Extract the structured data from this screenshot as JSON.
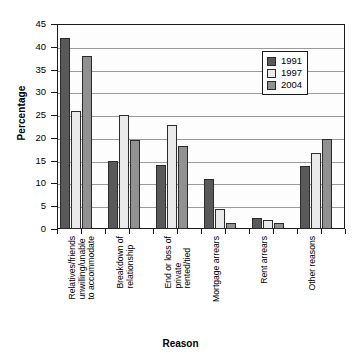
{
  "chart_data": {
    "type": "bar",
    "title": "",
    "xlabel": "Reason",
    "ylabel": "Percentage",
    "ylim": [
      0,
      45
    ],
    "ytick_step": 5,
    "yticks": [
      "0",
      "5",
      "10",
      "15",
      "20",
      "25",
      "30",
      "35",
      "40",
      "45"
    ],
    "grid": true,
    "legend_position": "top-right",
    "categories": [
      "Relatives/friends unwilling/unable to accommodate",
      "Breakdown of relationship",
      "End or loss of private rented/tied",
      "Mortgage arrears",
      "Rent arrears",
      "Other reasons"
    ],
    "category_lines": [
      [
        "Relatives/friends",
        "unwilling/unable",
        "to accommodate"
      ],
      [
        "Breakdown of",
        "relationship"
      ],
      [
        "End or loss of",
        "private",
        "rented/tied"
      ],
      [
        "Mortgage arrears"
      ],
      [
        "Rent arrears"
      ],
      [
        "Other reasons"
      ]
    ],
    "series": [
      {
        "name": "1991",
        "color": "#595959",
        "values": [
          42.0,
          15.0,
          14.0,
          10.9,
          2.4,
          13.9
        ]
      },
      {
        "name": "1997",
        "color": "#eaeaea",
        "values": [
          26.0,
          25.0,
          22.9,
          4.4,
          1.9,
          16.8
        ]
      },
      {
        "name": "2004",
        "color": "#919191",
        "values": [
          38.0,
          19.5,
          18.3,
          1.4,
          1.4,
          19.8
        ]
      }
    ]
  },
  "legend": {
    "items": [
      {
        "label": "1991",
        "color": "#595959"
      },
      {
        "label": "1997",
        "color": "#eaeaea"
      },
      {
        "label": "2004",
        "color": "#919191"
      }
    ]
  },
  "axis": {
    "y_title": "Percentage",
    "x_title": "Reason"
  }
}
